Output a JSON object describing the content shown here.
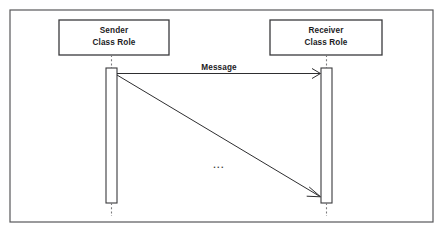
{
  "diagram": {
    "kind": "uml-sequence-diagram",
    "frame": {
      "x": 10,
      "y": 10,
      "width": 423,
      "height": 212,
      "border_color": "#58585a",
      "background_color": "#ffffff"
    },
    "ink_color": "#2e2e30",
    "participants": [
      {
        "id": "sender",
        "name_line1": "Sender",
        "name_line2": "Class Role",
        "box": {
          "x": 59,
          "y": 20,
          "width": 110,
          "height": 35
        },
        "lifeline_x": 111.5,
        "activation": {
          "x": 106,
          "y": 68,
          "width": 11,
          "height": 135
        },
        "lifeline_top": {
          "y1": 55,
          "y2": 68
        },
        "lifeline_bottom": {
          "y1": 203,
          "y2": 216
        }
      },
      {
        "id": "receiver",
        "name_line1": "Receiver",
        "name_line2": "Class Role",
        "box": {
          "x": 270,
          "y": 20,
          "width": 112,
          "height": 35
        },
        "lifeline_x": 326.5,
        "activation": {
          "x": 321,
          "y": 68,
          "width": 11,
          "height": 135
        },
        "lifeline_top": {
          "y1": 55,
          "y2": 68
        },
        "lifeline_bottom": {
          "y1": 203,
          "y2": 216
        }
      }
    ],
    "messages": [
      {
        "id": "message-horizontal",
        "label": "Message",
        "label_x": 219,
        "label_y": 70,
        "from_x": 117,
        "from_y": 73.5,
        "to_x": 320,
        "to_y": 73.5,
        "arrow_style": "open",
        "line_style": "solid"
      },
      {
        "id": "message-diagonal",
        "label": "",
        "from_x": 117,
        "from_y": 75,
        "to_x": 320,
        "to_y": 196.5,
        "arrow_style": "open",
        "line_style": "solid"
      }
    ],
    "ellipsis": {
      "text": "...",
      "x": 219,
      "y": 168
    }
  }
}
